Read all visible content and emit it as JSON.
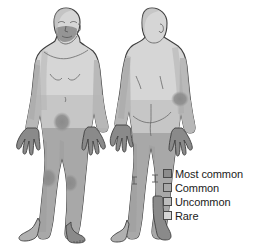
{
  "figure": {
    "views": [
      {
        "name": "anterior",
        "label": "Front view of human body"
      },
      {
        "name": "posterior",
        "label": "Back view of human body"
      }
    ],
    "palette": {
      "outline": "#3f3f3f",
      "background": "#ffffff",
      "most_common": "#8c8c8c",
      "common": "#a8a8a8",
      "uncommon": "#bdbdbd",
      "rare": "#d6d6d6",
      "shadow": "#9a9a9a"
    },
    "regions": [
      {
        "name": "face-beard-area",
        "view": "anterior",
        "severity": "most_common"
      },
      {
        "name": "left-hand",
        "view": "anterior",
        "severity": "most_common"
      },
      {
        "name": "right-hand",
        "view": "anterior",
        "severity": "most_common"
      },
      {
        "name": "groin",
        "view": "anterior",
        "severity": "most_common"
      },
      {
        "name": "left-knee",
        "view": "anterior",
        "severity": "most_common"
      },
      {
        "name": "right-knee",
        "view": "anterior",
        "severity": "most_common"
      },
      {
        "name": "right-foot",
        "view": "anterior",
        "severity": "most_common"
      },
      {
        "name": "lower-limbs",
        "view": "anterior",
        "severity": "common"
      },
      {
        "name": "torso",
        "view": "anterior",
        "severity": "rare"
      },
      {
        "name": "elbow",
        "view": "posterior",
        "severity": "most_common"
      },
      {
        "name": "left-hand",
        "view": "posterior",
        "severity": "most_common"
      },
      {
        "name": "right-hand",
        "view": "posterior",
        "severity": "most_common"
      },
      {
        "name": "ankle-calf",
        "view": "posterior",
        "severity": "most_common"
      },
      {
        "name": "lower-limbs",
        "view": "posterior",
        "severity": "common"
      },
      {
        "name": "back-torso",
        "view": "posterior",
        "severity": "rare"
      }
    ]
  },
  "legend": {
    "items": [
      {
        "label": "Most common",
        "color": "#8c8c8c"
      },
      {
        "label": "Common",
        "color": "#a8a8a8"
      },
      {
        "label": "Uncommon",
        "color": "#bdbdbd"
      },
      {
        "label": "Rare",
        "color": "#d6d6d6"
      }
    ]
  }
}
